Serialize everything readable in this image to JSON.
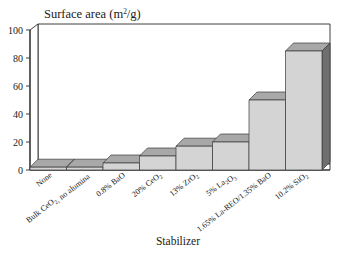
{
  "chart_data": {
    "type": "bar",
    "title": "Surface area (m2/g)",
    "title_parts": {
      "main": "Surface area (m",
      "superscript": "2",
      "tail": "/g)"
    },
    "xlabel": "Stabilizer",
    "ylabel": "",
    "ylim": [
      0,
      100
    ],
    "yticks": [
      0,
      20,
      40,
      60,
      80,
      100
    ],
    "ytick_labels": [
      "0",
      "20",
      "40",
      "60",
      "80",
      "100"
    ],
    "grid": false,
    "style": "3d-bars",
    "legend": "none",
    "categories": [
      "None",
      "Bulk CeO2, no alumina",
      "0.8% BaO",
      "20% CeO2",
      "13% ZrO2",
      "5% La2O3",
      "1.65% La-REO/1.35% BaO",
      "10.2% SiO2"
    ],
    "category_parts": [
      [
        {
          "t": "None",
          "k": "n"
        }
      ],
      [
        {
          "t": "Bulk CeO",
          "k": "n"
        },
        {
          "t": "2",
          "k": "sub"
        },
        {
          "t": ", no alumina",
          "k": "n"
        }
      ],
      [
        {
          "t": "0.8% BaO",
          "k": "n"
        }
      ],
      [
        {
          "t": "20% CeO",
          "k": "n"
        },
        {
          "t": "2",
          "k": "sub"
        }
      ],
      [
        {
          "t": "13% ZrO",
          "k": "n"
        },
        {
          "t": "2",
          "k": "sub"
        }
      ],
      [
        {
          "t": "5% La",
          "k": "n"
        },
        {
          "t": "2",
          "k": "sub"
        },
        {
          "t": "O",
          "k": "n"
        },
        {
          "t": "3",
          "k": "sub"
        }
      ],
      [
        {
          "t": "1.65% La-REO/1.35% BaO",
          "k": "n"
        }
      ],
      [
        {
          "t": "10.2% SiO",
          "k": "n"
        },
        {
          "t": "2",
          "k": "sub"
        }
      ]
    ],
    "values": [
      2,
      2,
      5,
      10,
      17,
      20,
      50,
      85
    ]
  },
  "colors": {
    "bar_front": "#d4d4d4",
    "bar_top": "#a8a8a8",
    "bar_side": "#6f6f6f",
    "axis": "#2b2b2b",
    "background": "#ffffff",
    "text": "#1a1a1a"
  }
}
